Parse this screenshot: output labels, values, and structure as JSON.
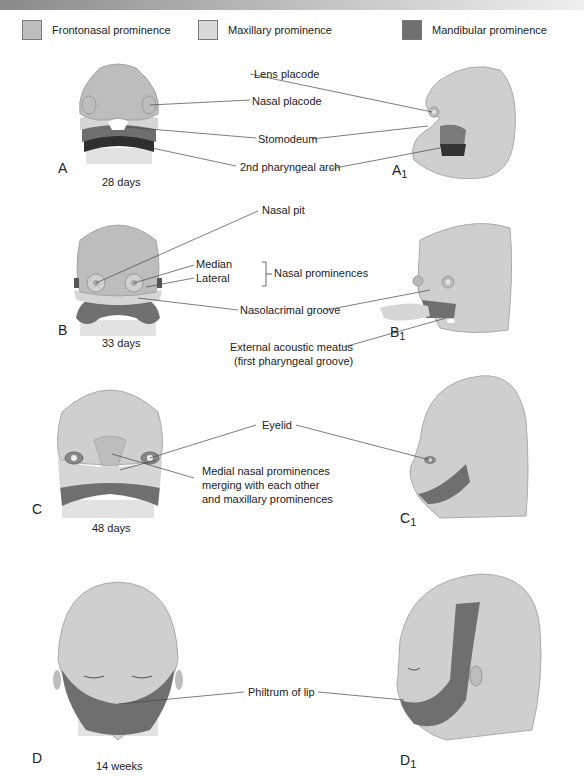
{
  "colors": {
    "frontonasal": "#bdbdbd",
    "maxillary": "#d9d9d9",
    "mandibular": "#6f6f6f",
    "second_arch": "#333333",
    "skin": "#cfcfcf",
    "line": "#444444"
  },
  "legend": [
    {
      "label": "Frontonasal prominence",
      "color_key": "frontonasal"
    },
    {
      "label": "Maxillary prominence",
      "color_key": "maxillary"
    },
    {
      "label": "Mandibular prominence",
      "color_key": "mandibular"
    }
  ],
  "stages": {
    "A": {
      "panel": "A",
      "panel_side": "A",
      "panel_side_sub": "1",
      "age": "28 days"
    },
    "B": {
      "panel": "B",
      "panel_side": "B",
      "panel_side_sub": "1",
      "age": "33 days"
    },
    "C": {
      "panel": "C",
      "panel_side": "C",
      "panel_side_sub": "1",
      "age": "48 days"
    },
    "D": {
      "panel": "D",
      "panel_side": "D",
      "panel_side_sub": "1",
      "age": "14 weeks"
    }
  },
  "labels": {
    "lens_placode": "Lens placode",
    "nasal_placode": "Nasal placode",
    "stomodeum": "Stomodeum",
    "second_pharyngeal_arch": "2nd pharyngeal arch",
    "nasal_pit": "Nasal pit",
    "median": "Median",
    "lateral": "Lateral",
    "nasal_prominences": "Nasal prominences",
    "nasolacrimal_groove": "Nasolacrimal groove",
    "external_acoustic_meatus_1": "External acoustic meatus",
    "external_acoustic_meatus_2": "(first pharyngeal groove)",
    "eyelid": "Eyelid",
    "medial_nasal_1": "Medial nasal prominences",
    "medial_nasal_2": "merging with each other",
    "medial_nasal_3": "and maxillary prominences",
    "philtrum": "Philtrum of lip"
  }
}
